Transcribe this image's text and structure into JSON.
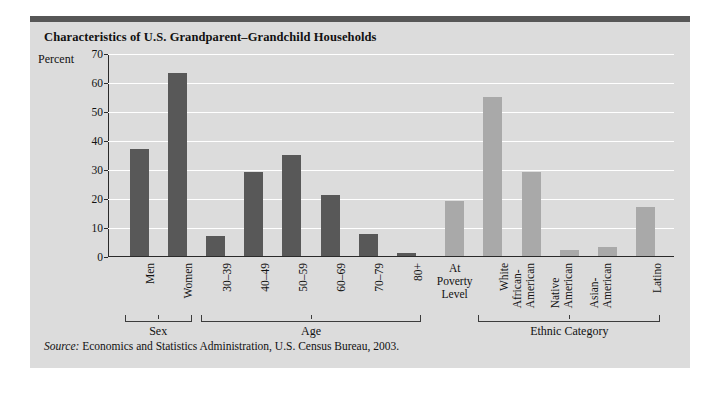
{
  "figure": {
    "title": "Characteristics of U.S. Grandparent–Grandchild Households",
    "source_prefix": "Source:",
    "source_text": " Economics and Statistics Administration, U.S. Census Bureau, 2003."
  },
  "colors": {
    "panel_background": "#dcdcdc",
    "top_rule": "#575757",
    "bar_dark": "#585858",
    "bar_light": "#a9a9a9",
    "gridline": "#ffffff",
    "axis": "#2a2a2a",
    "text": "#111111"
  },
  "chart_data": {
    "type": "bar",
    "title": "Characteristics of U.S. Grandparent–Grandchild Households",
    "xlabel": "",
    "ylabel": "Percent",
    "ylim": [
      0,
      70
    ],
    "yticks": [
      0,
      10,
      20,
      30,
      40,
      50,
      60,
      70
    ],
    "grid": true,
    "legend": "none",
    "categories": [
      "Men",
      "Women",
      "30–39",
      "40–49",
      "50–59",
      "60–69",
      "70–79",
      "80+",
      "At Poverty Level",
      "White",
      "African-American",
      "Native American",
      "Asian-American",
      "Latino"
    ],
    "values": [
      37,
      63,
      7,
      29,
      35,
      21,
      7.5,
      1,
      19,
      55,
      29,
      2,
      3,
      17
    ],
    "bar_shades": [
      "dark",
      "dark",
      "dark",
      "dark",
      "dark",
      "dark",
      "dark",
      "dark",
      "light",
      "light",
      "light",
      "light",
      "light",
      "light"
    ],
    "groups": [
      {
        "label": "Sex",
        "start_index": 0,
        "end_index": 1
      },
      {
        "label": "Age",
        "start_index": 2,
        "end_index": 7
      },
      {
        "label": "Ethnic Category",
        "start_index": 9,
        "end_index": 13
      }
    ]
  },
  "tick_text_lines": {
    "Men": [
      "Men"
    ],
    "Women": [
      "Women"
    ],
    "30–39": [
      "30–39"
    ],
    "40–49": [
      "40–49"
    ],
    "50–59": [
      "50–59"
    ],
    "60–69": [
      "60–69"
    ],
    "70–79": [
      "70–79"
    ],
    "80+": [
      "80+"
    ],
    "At Poverty Level": [
      "At",
      "Poverty",
      "Level"
    ],
    "White": [
      "White"
    ],
    "African-American": [
      "African-",
      "American"
    ],
    "Native American": [
      "Native",
      "American"
    ],
    "Asian-American": [
      "Asian-",
      "American"
    ],
    "Latino": [
      "Latino"
    ]
  }
}
